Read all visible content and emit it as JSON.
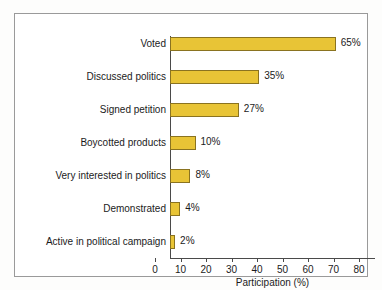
{
  "chart_data": {
    "type": "bar",
    "orientation": "horizontal",
    "title": "",
    "subtitle": "",
    "xlabel": "Participation (%)",
    "ylabel": "",
    "xlim": [
      0,
      80
    ],
    "xticks": [
      "0",
      "10",
      "20",
      "30",
      "40",
      "50",
      "60",
      "70",
      "80"
    ],
    "grid": false,
    "legend": null,
    "categories": [
      "Voted",
      "Discussed politics",
      "Signed petition",
      "Boycotted products",
      "Very interested in politics",
      "Demonstrated",
      "Active in political campaign"
    ],
    "values": [
      65,
      35,
      27,
      10,
      8,
      4,
      2
    ],
    "data_labels": [
      "65%",
      "35%",
      "27%",
      "10%",
      "8%",
      "4%",
      "2%"
    ],
    "bar_color": "#e8c436",
    "bar_edge_color": "#8a7320",
    "axis_color": "#4a4a4a",
    "frame_color": "#9a9a9a",
    "background_color": "#ffffff"
  }
}
